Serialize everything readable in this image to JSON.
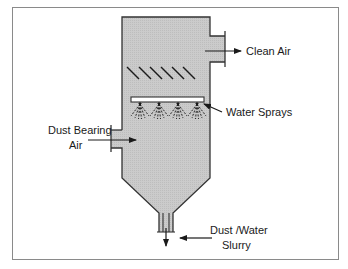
{
  "diagram": {
    "colors": {
      "vessel_fill": "#c9c9c9",
      "stroke": "#333333",
      "frame": "#8a8a8a",
      "spray_bar_fill": "#ffffff"
    },
    "labels": {
      "clean_air": "Clean Air",
      "water_sprays": "Water Sprays",
      "dust_bearing_line1": "Dust Bearing",
      "dust_bearing_line2": "Air",
      "slurry_line1": "Dust /Water",
      "slurry_line2": "Slurry"
    },
    "components": {
      "mist_eliminator_blades": 6,
      "spray_nozzles": 4
    }
  }
}
